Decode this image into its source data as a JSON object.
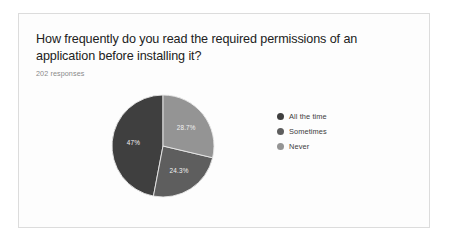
{
  "card": {
    "question": "How frequently do you read the required permissions of an application before installing it?",
    "response_count": "202 responses"
  },
  "legend": {
    "items": [
      {
        "label": "All the time",
        "color": "#3f3f3f"
      },
      {
        "label": "Sometimes",
        "color": "#5e5e5e"
      },
      {
        "label": "Never",
        "color": "#949494"
      }
    ]
  },
  "chart_data": {
    "type": "pie",
    "title": "How frequently do you read the required permissions of an application before installing it?",
    "subtitle": "202 responses",
    "categories": [
      "All the time",
      "Sometimes",
      "Never"
    ],
    "values": [
      47,
      24.3,
      28.7
    ],
    "value_labels": [
      "47%",
      "24.3%",
      "28.7%"
    ],
    "colors": [
      "#3f3f3f",
      "#5e5e5e",
      "#949494"
    ],
    "legend_position": "right",
    "start_angle_deg": 0,
    "direction": "counterclockwise",
    "total_responses": 202,
    "grid": false,
    "xlabel": "",
    "ylabel": ""
  }
}
